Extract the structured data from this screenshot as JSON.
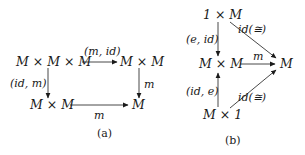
{
  "diagrams": [
    {
      "id": "a",
      "caption": "(a)",
      "nodes": {
        "top_left": "M × M × M",
        "top_right": "M × M",
        "bottom_left": "M × M",
        "bottom_right": "M"
      },
      "arrows": {
        "top": "(m, id)",
        "left": "(id, m)",
        "right": "m",
        "bottom": "m"
      }
    },
    {
      "id": "b",
      "caption": "(b)",
      "nodes": {
        "top": "1 × M",
        "middle": "M × M",
        "right": "M",
        "bottom": "M × 1"
      },
      "arrows": {
        "top_down": "(e, id)",
        "bottom_up": "(id, e)",
        "middle": "m",
        "top_diag": "id(≅)",
        "bottom_diag": "id(≅)"
      }
    }
  ]
}
